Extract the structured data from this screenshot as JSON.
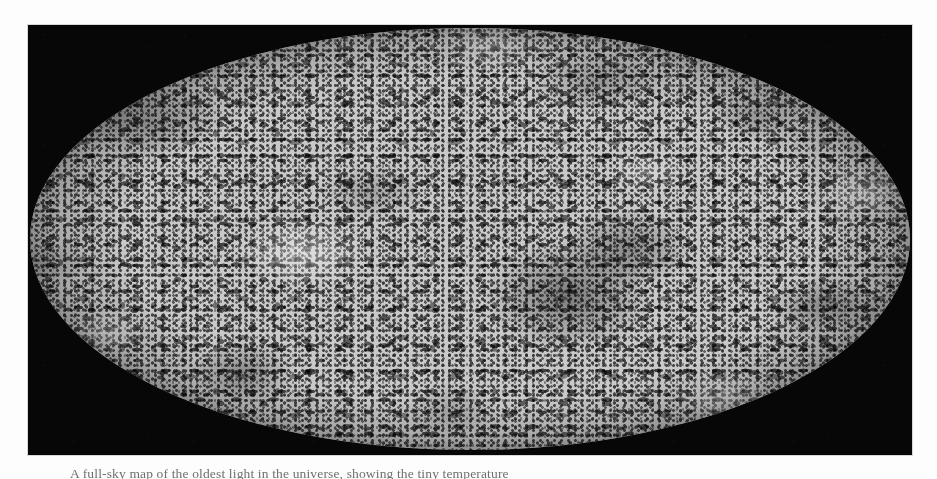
{
  "page": {
    "background_color": "#fdfdfd",
    "type": "scanned-book-page"
  },
  "figure": {
    "name": "cosmic-microwave-background-all-sky-map",
    "projection": "Mollweide",
    "colormap": "grayscale",
    "plate_background_color": "#070707",
    "map_base_color": "#c9c9c9"
  },
  "caption": {
    "text": "A full-sky map of the oldest light in the universe, showing the tiny temperature"
  },
  "chart_data": {
    "type": "heatmap",
    "title": "",
    "xlabel": "",
    "ylabel": "",
    "projection": "Mollweide full-sky",
    "colormap": "grayscale (dark = cold / light = hot)",
    "grid": false,
    "legend": "none"
  }
}
